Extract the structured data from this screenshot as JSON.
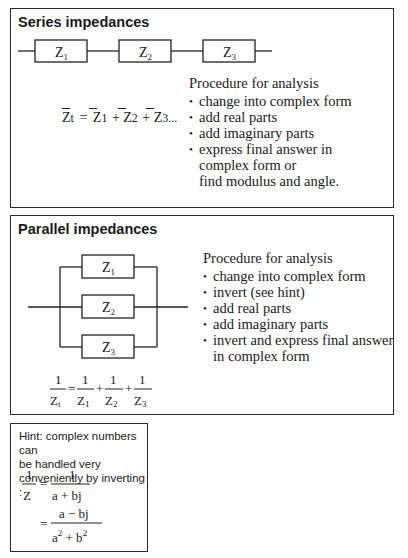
{
  "series": {
    "title": "Series impedances",
    "components": [
      {
        "symbol": "Z",
        "subscript": "1"
      },
      {
        "symbol": "Z",
        "subscript": "2"
      },
      {
        "symbol": "Z",
        "subscript": "3"
      }
    ],
    "formula": {
      "lhs": "Z",
      "lhs_sub": "t",
      "equals": "=",
      "terms": [
        {
          "symbol": "Z",
          "subscript": "1"
        },
        {
          "symbol": "Z",
          "subscript": "2"
        },
        {
          "symbol": "Z",
          "subscript": "3"
        }
      ],
      "plus": "+",
      "ellipsis": "..."
    },
    "procedure": {
      "heading": "Procedure for analysis",
      "steps": [
        {
          "text": "change into complex form"
        },
        {
          "text": "add real parts"
        },
        {
          "text": "add imaginary parts"
        },
        {
          "text": "express final answer in",
          "cont1": "complex form or",
          "cont2": "find modulus and angle."
        }
      ]
    }
  },
  "parallel": {
    "title": "Parallel impedances",
    "components": [
      {
        "symbol": "Z",
        "subscript": "1"
      },
      {
        "symbol": "Z",
        "subscript": "2"
      },
      {
        "symbol": "Z",
        "subscript": "3"
      }
    ],
    "formula": {
      "numerator": "1",
      "lhs_den": "Z",
      "lhs_sub": "t",
      "equals": "=",
      "plus": "+",
      "terms": [
        {
          "symbol": "Z",
          "subscript": "1"
        },
        {
          "symbol": "Z",
          "subscript": "2"
        },
        {
          "symbol": "Z",
          "subscript": "3"
        }
      ]
    },
    "procedure": {
      "heading": "Procedure for analysis",
      "steps": [
        {
          "text": "change into complex form"
        },
        {
          "text": "invert (see hint)"
        },
        {
          "text": "add real parts"
        },
        {
          "text": "add imaginary parts"
        },
        {
          "text": "invert and express final answer",
          "cont1": "in complex form"
        }
      ]
    }
  },
  "hint": {
    "line1": "Hint: complex numbers can",
    "line2": "be handled very",
    "line3": "conveniently by inverting :",
    "eq1": {
      "num_left": "1",
      "den_left": "Z",
      "equals": "=",
      "num_right": "1",
      "den_right": "a + bj"
    },
    "eq2": {
      "equals": "=",
      "num": "a − bj",
      "den_a": "a",
      "den_plus": " + b",
      "exp": "2"
    }
  }
}
